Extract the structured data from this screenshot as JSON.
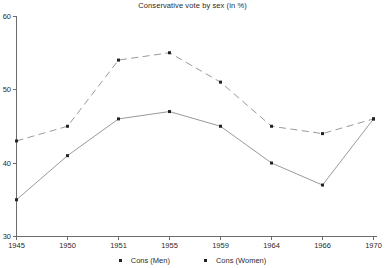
{
  "title": "Conservative vote by sex (in %)",
  "colors": {
    "background": "#ffffff",
    "axis": "#6b6b6b",
    "line": "#9a9a9a",
    "marker": "#232323",
    "text": "#2b2b2b"
  },
  "legend": {
    "men_label": "Cons (Men)",
    "women_label": "Cons (Women)"
  },
  "chart_data": {
    "type": "line",
    "title": "Conservative vote by sex (in %)",
    "categories": [
      "1945",
      "1950",
      "1951",
      "1955",
      "1959",
      "1964",
      "1966",
      "1970"
    ],
    "series": [
      {
        "name": "Cons (Men)",
        "style": "solid",
        "values": [
          35,
          41,
          46,
          47,
          45,
          40,
          37,
          46
        ]
      },
      {
        "name": "Cons (Women)",
        "style": "dashed",
        "values": [
          43,
          45,
          54,
          55,
          51,
          45,
          44,
          46
        ]
      }
    ],
    "xlabel": "",
    "ylabel": "",
    "ylim": [
      30,
      60
    ],
    "yticks": [
      30,
      40,
      50,
      60
    ],
    "grid": false,
    "legend_position": "bottom"
  }
}
